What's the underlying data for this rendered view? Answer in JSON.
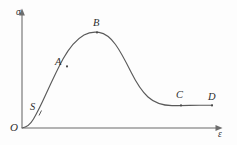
{
  "figure": {
    "name": "stress-strain-curve",
    "background_color": "#fdfdfd",
    "width": 237,
    "height": 145
  },
  "axes": {
    "y_label": "σ",
    "x_label": "ε",
    "origin_label": "O",
    "axis_color": "#9a9a9a",
    "arrow_color": "#6d6d6d",
    "origin_px": [
      22,
      128
    ],
    "y_top_px": [
      22,
      12
    ],
    "x_right_px": [
      222,
      128
    ],
    "grid": "off",
    "ticks": "none"
  },
  "curve": {
    "color": "#5a5a5a",
    "stroke_width": 1.15,
    "path": "M 22 128 C 26 127.5 30 125 33.5 119 C 37 113 41 105 46 94 C 51.5 82 57 70 63 59 C 69.5 47.5 77 39 84 35 C 89 32.2 94 31.6 99 32.4 C 105 33.4 110.5 37.5 115.5 44.5 C 121 52 126 62 131 72 C 136.5 83 142 91.5 148 97 C 155 103.3 163 105.5 172 105.6 C 180 105.7 190 105.4 199.5 105.3 C 205 105.25 209 105.2 212.5 105.2"
  },
  "chart_data": {
    "type": "line",
    "title": "",
    "xlabel": "ε",
    "ylabel": "σ",
    "legend": "none",
    "grid": false,
    "series": [
      {
        "name": "stress-strain",
        "description": "sigmoidal rise to a peak then decay to a flat plateau",
        "x": [
          0,
          0.06,
          0.12,
          0.2,
          0.28,
          0.35,
          0.385,
          0.45,
          0.52,
          0.6,
          0.7,
          0.8,
          0.9,
          0.95
        ],
        "y": [
          0,
          0.1,
          0.23,
          0.45,
          0.68,
          0.8,
          0.83,
          0.78,
          0.62,
          0.45,
          0.28,
          0.21,
          0.2,
          0.2
        ]
      }
    ],
    "points": [
      {
        "id": "S",
        "label": "S",
        "x_px": 40,
        "y_px": 112,
        "note": "lower inflection / onset"
      },
      {
        "id": "A",
        "label": "A",
        "x_px": 67,
        "y_px": 66,
        "note": "rising limb"
      },
      {
        "id": "B",
        "label": "B",
        "x_px": 97,
        "y_px": 32,
        "note": "peak / maximum stress"
      },
      {
        "id": "C",
        "label": "C",
        "x_px": 181,
        "y_px": 105,
        "note": "plateau"
      },
      {
        "id": "D",
        "label": "D",
        "x_px": 212,
        "y_px": 105,
        "note": "end point"
      }
    ],
    "xlim": [
      0,
      1
    ],
    "ylim": [
      0,
      1
    ]
  },
  "labels": {
    "sigma": {
      "text": "σ",
      "left": 16,
      "top": 8
    },
    "epsilon": {
      "text": "ε",
      "left": 218,
      "top": 130
    },
    "origin": {
      "text": "O",
      "left": 10,
      "top": 122
    },
    "S": {
      "text": "S",
      "left": 30,
      "top": 102
    },
    "A": {
      "text": "A",
      "left": 55,
      "top": 57
    },
    "B": {
      "text": "B",
      "left": 93,
      "top": 18
    },
    "C": {
      "text": "C",
      "left": 176,
      "top": 90
    },
    "D": {
      "text": "D",
      "left": 208,
      "top": 92
    }
  }
}
